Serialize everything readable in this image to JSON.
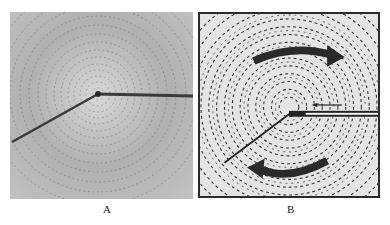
{
  "figure": {
    "panels": [
      {
        "id": "A",
        "label": "A",
        "description": "Iron filings forming concentric circles around a current-carrying wire (photograph)"
      },
      {
        "id": "B",
        "label": "B",
        "description": "Drawing of iron filing pattern with curved arrows showing circular field direction"
      }
    ]
  },
  "colors": {
    "panel_a_bg": "#b9b9b9",
    "panel_b_bg": "#e4e4e4",
    "ink": "#2a2a2a"
  }
}
